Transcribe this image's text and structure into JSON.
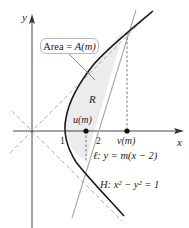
{
  "figure": {
    "axes": {
      "x_label": "x",
      "y_label": "y"
    },
    "callout": {
      "text_prefix": "Area = ",
      "text_value": "A(m)"
    },
    "region_label": "R",
    "points": {
      "u": {
        "label": "u(m)"
      },
      "v": {
        "label": "v(m)"
      }
    },
    "ticks": {
      "one": "1",
      "two": "2"
    },
    "line_label": "ℓ: y = m(x − 2)",
    "hyperbola_label": "H: x² − y² = 1",
    "colors": {
      "curve": "#1a1a1a",
      "line": "#a8a8a8",
      "asymptote": "#b0b0b0",
      "region_fill": "#ececec",
      "axes": "#333333"
    }
  }
}
